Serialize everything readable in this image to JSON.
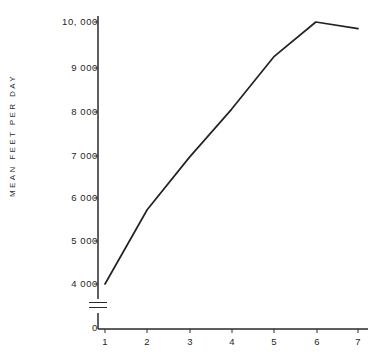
{
  "chart_data": {
    "type": "line",
    "title": "",
    "xlabel": "",
    "ylabel": "MEAN FEET PER DAY",
    "x": [
      1,
      2,
      3,
      4,
      5,
      6,
      7
    ],
    "values": [
      4000,
      5700,
      6900,
      8000,
      9200,
      10000,
      9850
    ],
    "series": [
      {
        "name": "mean feet per day",
        "values": [
          4000,
          5700,
          6900,
          8000,
          9200,
          10000,
          9850
        ]
      }
    ],
    "xlim": [
      0.6,
      7.2
    ],
    "ylim": [
      4000,
      10200
    ],
    "y_axis_break": true,
    "y_axis_break_label": "0",
    "grid": false,
    "legend": false,
    "line_color": "#222222"
  },
  "axes": {
    "y_ticks": [
      {
        "value": 10000,
        "label": "10, 000",
        "y": 22
      },
      {
        "value": 9000,
        "label": "9 000",
        "y": 68
      },
      {
        "value": 8000,
        "label": "8 000",
        "y": 112
      },
      {
        "value": 7000,
        "label": "7 000",
        "y": 156
      },
      {
        "value": 6000,
        "label": "6 000",
        "y": 198
      },
      {
        "value": 5000,
        "label": "5 000",
        "y": 241
      },
      {
        "value": 4000,
        "label": "4 000",
        "y": 284
      },
      {
        "value": 0,
        "label": "0",
        "y": 328
      }
    ],
    "x_ticks": [
      {
        "value": 1,
        "label": "1",
        "x": 105
      },
      {
        "value": 2,
        "label": "2",
        "x": 147
      },
      {
        "value": 3,
        "label": "3",
        "x": 190
      },
      {
        "value": 4,
        "label": "4",
        "x": 232
      },
      {
        "value": 5,
        "label": "5",
        "x": 274
      },
      {
        "value": 6,
        "label": "6",
        "x": 317
      },
      {
        "value": 7,
        "label": "7",
        "x": 358
      }
    ],
    "y_title": "MEAN FEET PER DAY"
  },
  "caption": {
    "text": ""
  }
}
